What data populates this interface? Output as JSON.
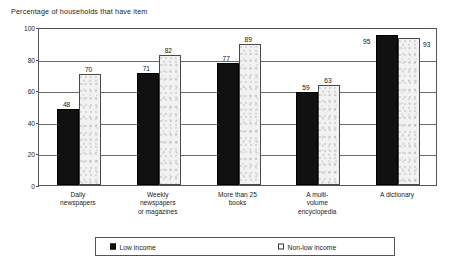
{
  "chart_data": {
    "type": "bar",
    "title": "Percentage of households that have item",
    "xlabel": "",
    "ylabel": "",
    "ylim": [
      0,
      100
    ],
    "yticks": [
      0,
      20,
      40,
      60,
      80,
      100
    ],
    "grid": true,
    "legend_position": "bottom",
    "categories": [
      "Daily newspapers",
      "Weekly newspapers or magazines",
      "More than 25 books",
      "A multi-volume encyclopedia",
      "A dictionary"
    ],
    "category_lines": [
      [
        "Daily",
        "newspapers"
      ],
      [
        "Weekly",
        "newspapers",
        "or magazines"
      ],
      [
        "More than 25",
        "books"
      ],
      [
        "A multi-",
        "volume",
        "encyclopedia"
      ],
      [
        "A dictionary"
      ]
    ],
    "series": [
      {
        "name": "Low income",
        "color": "#111111",
        "values": [
          48,
          71,
          77,
          59,
          95
        ]
      },
      {
        "name": "Non-low income",
        "color": "#f2f2f2",
        "values": [
          70,
          82,
          89,
          63,
          93
        ]
      }
    ]
  },
  "legend": {
    "low_label": "Low income",
    "nonlow_label": "Non-low income"
  }
}
